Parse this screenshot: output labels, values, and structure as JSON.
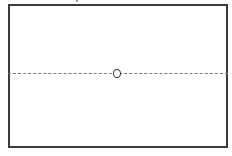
{
  "diagram": {
    "frame": {
      "shape": "rectangle",
      "stroke": "#3a3a3a"
    },
    "axis_line": {
      "style": "dashed",
      "orientation": "horizontal",
      "stroke": "#7a7a7a"
    },
    "center_marker": {
      "shape": "circle",
      "label": ""
    }
  }
}
